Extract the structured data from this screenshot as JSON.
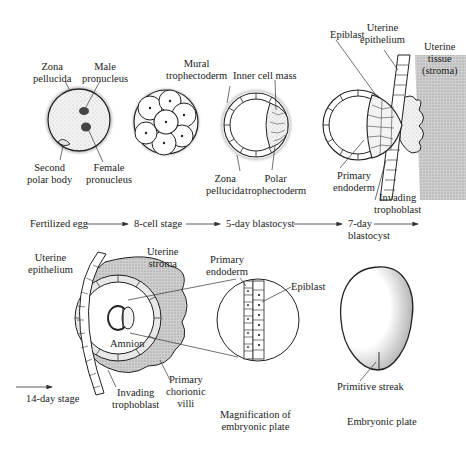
{
  "stages": [
    {
      "name": "Fertilized egg",
      "labels": [
        "Zona pellucida",
        "Male pronucleus",
        "Second polar body",
        "Female pronucleus"
      ]
    },
    {
      "name": "8-cell stage",
      "labels": []
    },
    {
      "name": "5-day blastocyst",
      "labels": [
        "Mural trophectoderm",
        "Inner cell mass",
        "Zona pellucida",
        "Polar trophectoderm"
      ]
    },
    {
      "name": "7-day blastocyst",
      "labels": [
        "Epiblast",
        "Uterine epithelium",
        "Uterine tissue (stroma)",
        "Primary endoderm",
        "Invading trophoblast"
      ]
    },
    {
      "name": "14-day stage",
      "labels": [
        "Uterine epithelium",
        "Uterine stroma",
        "Amnion",
        "Invading trophoblast",
        "Primary chorionic villi"
      ]
    }
  ],
  "timeline": {
    "s1": "Fertilized egg",
    "s2": "8-cell stage",
    "s3": "5-day blastocyst",
    "s4a": "7-day",
    "s4b": "blastocyst",
    "s5": "14-day stage"
  },
  "egg": {
    "zona1": "Zona",
    "zona2": "pellucida",
    "male1": "Male",
    "male2": "pronucleus",
    "polar1": "Second",
    "polar2": "polar body",
    "female1": "Female",
    "female2": "pronucleus"
  },
  "blasto5": {
    "mural1": "Mural",
    "mural2": "trophectoderm",
    "icm": "Inner cell mass",
    "zona1": "Zona",
    "zona2": "pellucida",
    "polar1": "Polar",
    "polar2": "trophectoderm"
  },
  "blasto7": {
    "epiblast": "Epiblast",
    "ue1": "Uterine",
    "ue2": "epithelium",
    "ut1": "Uterine",
    "ut2": "tissue",
    "ut3": "(stroma)",
    "pe1": "Primary",
    "pe2": "endoderm",
    "it1": "Invading",
    "it2": "trophoblast"
  },
  "day14": {
    "ue1": "Uterine",
    "ue2": "epithelium",
    "us1": "Uterine",
    "us2": "stroma",
    "amnion": "Amnion",
    "it1": "Invading",
    "it2": "trophoblast",
    "pcv1": "Primary",
    "pcv2": "chorionic",
    "pcv3": "villi"
  },
  "magnify": {
    "pe1": "Primary",
    "pe2": "endoderm",
    "epiblast": "Epiblast",
    "cap1": "Magnification of",
    "cap2": "embryonic plate"
  },
  "plate": {
    "streak": "Primitive streak",
    "caption": "Embryonic plate"
  }
}
